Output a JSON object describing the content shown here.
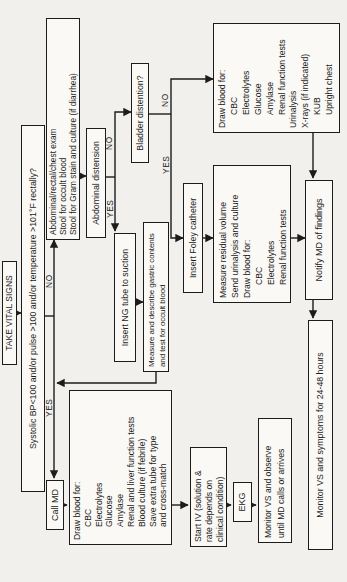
{
  "diagram": {
    "type": "flowchart"
  },
  "colors": {
    "ink": "#1c1c1c",
    "paper": "#f1f0ec",
    "box_fill": "#faf9f5"
  },
  "nodes": {
    "take_vital_signs": {
      "label": "TAKE VITAL SIGNS"
    },
    "vitals_question": {
      "label": "Systolic BP<100 and/or pulse >100 and/or temperature >101°F rectally?"
    },
    "call_md": {
      "label": "Call MD"
    },
    "draw_blood_yes": {
      "lines": [
        "Draw blood for:",
        "CBC",
        "Electrolytes",
        "Glucose",
        "Amylase",
        "Renal and liver function tests",
        "Blood culture (if febrile)",
        "Save extra tube for type",
        "and cross-match"
      ]
    },
    "start_iv": {
      "lines": [
        "Start IV (solution &",
        "rate depends on",
        "clinical condition)"
      ]
    },
    "ekg": {
      "label": "EKG"
    },
    "monitor_observe": {
      "lines": [
        "Monitor VS and observe",
        "until MD calls or arrives"
      ]
    },
    "abdominal_exam": {
      "lines": [
        "Abdominal/rectal/chest exam",
        "Stool for occult blood",
        "Stool for Gram stain and culture (if diarrhea)"
      ]
    },
    "abdominal_distension": {
      "label": "Abdominal distension"
    },
    "insert_ng": {
      "label": "Insert NG tube to suction"
    },
    "measure_gastric": {
      "lines": [
        "Measure and describe gastric contents",
        "and test for occult blood"
      ]
    },
    "bladder_distention": {
      "label": "Bladder distention?"
    },
    "insert_foley": {
      "label": "Insert Foley catheter"
    },
    "measure_residual": {
      "lines": [
        "Measure residual volume",
        "Send urinalysis and culture",
        "Draw blood for:",
        "CBC",
        "Electrolytes",
        "Renal function tests"
      ]
    },
    "draw_blood_no": {
      "lines": [
        "Draw blood for:",
        "CBC",
        "Electrolytes",
        "Glucose",
        "Amylase",
        "Renal function tests",
        "Urinalysis",
        "X-rays (if indicated)",
        "KUB",
        "Upright chest"
      ]
    },
    "notify_md": {
      "label": "Notify MD  of findings"
    },
    "monitor_symptoms": {
      "label": "Monitor VS and symptoms for 24-48 hours"
    }
  },
  "branch_labels": {
    "vitals_yes": "YES",
    "vitals_no": "NO",
    "distension_yes": "YES",
    "distension_no": "NO",
    "bladder_yes": "YES",
    "bladder_no": "NO"
  },
  "edges": [
    {
      "from": "take_vital_signs",
      "to": "vitals_question"
    },
    {
      "from": "vitals_question",
      "to": "call_md",
      "label": "YES"
    },
    {
      "from": "vitals_question",
      "to": "abdominal_exam",
      "label": "NO"
    },
    {
      "from": "call_md",
      "to": "draw_blood_yes"
    },
    {
      "from": "draw_blood_yes",
      "to": "start_iv"
    },
    {
      "from": "start_iv",
      "to": "ekg"
    },
    {
      "from": "ekg",
      "to": "monitor_observe"
    },
    {
      "from": "abdominal_exam",
      "to": "abdominal_distension"
    },
    {
      "from": "abdominal_distension",
      "to": "insert_ng",
      "label": "YES"
    },
    {
      "from": "abdominal_distension",
      "to": "bladder_distention",
      "label": "NO"
    },
    {
      "from": "insert_ng",
      "to": "measure_gastric"
    },
    {
      "from": "measure_gastric",
      "to": "call_md"
    },
    {
      "from": "bladder_distention",
      "to": "insert_foley",
      "label": "YES"
    },
    {
      "from": "bladder_distention",
      "to": "draw_blood_no",
      "label": "NO"
    },
    {
      "from": "insert_foley",
      "to": "measure_residual"
    },
    {
      "from": "measure_residual",
      "to": "notify_md"
    },
    {
      "from": "draw_blood_no",
      "to": "notify_md"
    },
    {
      "from": "notify_md",
      "to": "monitor_symptoms"
    }
  ]
}
